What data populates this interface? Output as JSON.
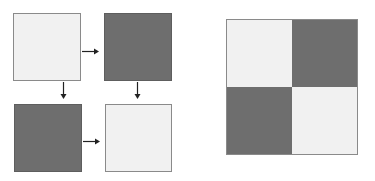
{
  "diagram": {
    "colors": {
      "light": "#f1f1f1",
      "dark": "#6e6e6e",
      "arrow": "#222222",
      "border": "#8a8a8a"
    },
    "left_flow": {
      "squares": [
        {
          "id": "top-left",
          "shade": "light"
        },
        {
          "id": "top-right",
          "shade": "dark"
        },
        {
          "id": "bottom-left",
          "shade": "dark"
        },
        {
          "id": "bottom-right",
          "shade": "light"
        }
      ],
      "arrows": [
        {
          "from": "top-left",
          "to": "top-right",
          "direction": "right"
        },
        {
          "from": "top-left",
          "to": "bottom-left",
          "direction": "down"
        },
        {
          "from": "top-right",
          "to": "bottom-right",
          "direction": "down"
        },
        {
          "from": "bottom-left",
          "to": "bottom-right",
          "direction": "right"
        }
      ]
    },
    "checkerboard": {
      "cells": [
        {
          "position": "top-left",
          "shade": "light"
        },
        {
          "position": "top-right",
          "shade": "dark"
        },
        {
          "position": "bottom-left",
          "shade": "dark"
        },
        {
          "position": "bottom-right",
          "shade": "light"
        }
      ]
    }
  }
}
